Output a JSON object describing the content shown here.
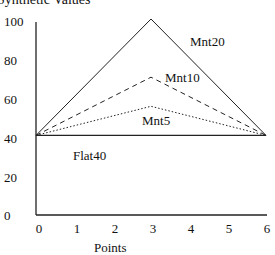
{
  "chart_data": {
    "type": "line",
    "title": "Synthetic Values",
    "xlabel": "Points",
    "ylabel": "",
    "x": [
      0,
      3,
      6
    ],
    "xlim": [
      0,
      6
    ],
    "ylim": [
      0,
      100
    ],
    "xticks": [
      "0",
      "1",
      "2",
      "3",
      "4",
      "5",
      "6"
    ],
    "yticks": [
      "0",
      "20",
      "40",
      "60",
      "80",
      "100"
    ],
    "grid": false,
    "legend": "inline labels",
    "series": [
      {
        "name": "Mnt20",
        "values": [
          40,
          100,
          40
        ],
        "style": "solid"
      },
      {
        "name": "Mnt10",
        "values": [
          40,
          70,
          40
        ],
        "style": "dashed"
      },
      {
        "name": "Mnt5",
        "values": [
          40,
          55,
          40
        ],
        "style": "dotted"
      },
      {
        "name": "Flat40",
        "values": [
          40,
          40,
          40
        ],
        "style": "solid"
      }
    ]
  }
}
